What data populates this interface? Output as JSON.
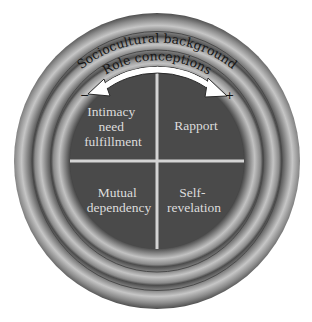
{
  "diagram": {
    "rings": {
      "outer": {
        "label": "Sociocultural background"
      },
      "middle": {
        "label": "Role conceptions"
      },
      "inner": {
        "label": ""
      }
    },
    "arrow": {
      "type": "double-headed-arc",
      "left_sign": "−",
      "right_sign": "+"
    },
    "quadrants": [
      {
        "position": "top-left",
        "lines": [
          "Intimacy",
          "need",
          "fulfillment"
        ]
      },
      {
        "position": "top-right",
        "lines": [
          "Rapport"
        ]
      },
      {
        "position": "bottom-left",
        "lines": [
          "Mutual",
          "dependency"
        ]
      },
      {
        "position": "bottom-right",
        "lines": [
          "Self-",
          "revelation"
        ]
      }
    ],
    "colors": {
      "background": "#ffffff",
      "core": "#4a4a4a",
      "ring_dark": "#4e4e4e",
      "ring_light": "#c4c4c4",
      "divider": "#d4d4d4",
      "quad_text": "#dcdcdc",
      "ring_text": "#161616",
      "arrow_fill": "#ffffff",
      "arrow_stroke": "#2a2a2a"
    }
  }
}
